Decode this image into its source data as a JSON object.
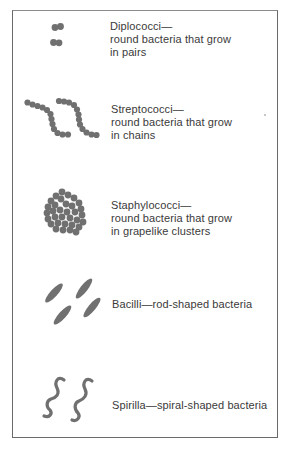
{
  "figure": {
    "colors": {
      "frame": "#6a6a6a",
      "organism": "#707070",
      "text": "#3a3a3a"
    },
    "items": [
      {
        "name": "Diplococci",
        "title": "Diplococci—",
        "line2": "round bacteria that grow",
        "line3": "in pairs",
        "icon": "diplococci-icon"
      },
      {
        "name": "Streptococci",
        "title": "Streptococci—",
        "line2": "round bacteria that grow",
        "line3": "in chains",
        "icon": "streptococci-icon"
      },
      {
        "name": "Staphylococci",
        "title": "Staphylococci—",
        "line2": "round bacteria that grow",
        "line3": "in grapelike clusters",
        "icon": "staphylococci-icon"
      },
      {
        "name": "Bacilli",
        "title": "Bacilli—rod-shaped bacteria",
        "icon": "bacilli-icon"
      },
      {
        "name": "Spirilla",
        "title": "Spirilla—spiral-shaped bacteria",
        "icon": "spirilla-icon"
      }
    ]
  }
}
